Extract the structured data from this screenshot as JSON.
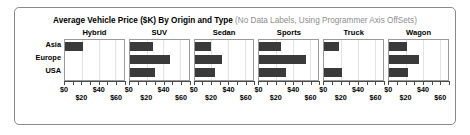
{
  "chart_data": {
    "type": "bar",
    "orientation": "horizontal",
    "title_main": "Average Vehicle Price ($K) By Origin and Type",
    "title_sub": "(No Data Labels, Using Programmer Axis OffSets)",
    "xlabel": "",
    "ylabel": "",
    "xlim": [
      0,
      70
    ],
    "grid": true,
    "legend": "none",
    "categories": [
      "Asia",
      "Europe",
      "USA"
    ],
    "panel_titles": [
      "Hybrid",
      "SUV",
      "Sedan",
      "Sports",
      "Truck",
      "Wagon"
    ],
    "tick_values": [
      0,
      20,
      40,
      60
    ],
    "tick_labels": [
      "$0",
      "$20",
      "$40",
      "$60"
    ],
    "tick_label_rows": [
      "up",
      "down",
      "up",
      "down"
    ],
    "bar_color": "#3a3a3a",
    "panels": [
      {
        "name": "Hybrid",
        "values": [
          22,
          null,
          null
        ]
      },
      {
        "name": "SUV",
        "values": [
          28,
          48,
          30
        ]
      },
      {
        "name": "Sedan",
        "values": [
          19,
          33,
          24
        ]
      },
      {
        "name": "Sports",
        "values": [
          26,
          55,
          32
        ]
      },
      {
        "name": "Truck",
        "values": [
          18,
          null,
          21
        ]
      },
      {
        "name": "Wagon",
        "values": [
          21,
          35,
          22
        ]
      }
    ]
  },
  "ylabels": {
    "row0": "Asia",
    "row1": "Europe",
    "row2": "USA"
  }
}
